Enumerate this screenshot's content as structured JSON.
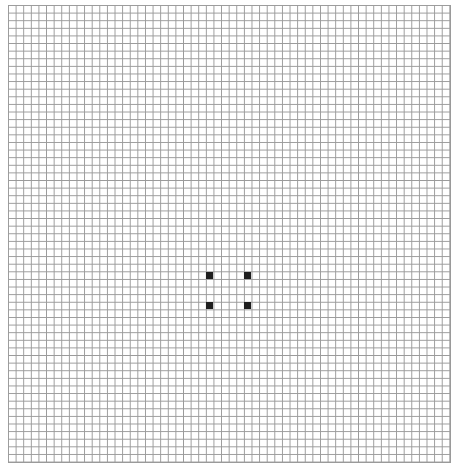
{
  "game": {
    "type": "cellular-automaton-grid",
    "columns": 58,
    "rows": 60,
    "cell_size_px": 7.62,
    "grid_color": "#9a9a9a",
    "live_color": "#1e1e1e",
    "dead_color": "#ffffff",
    "live_cells": [
      {
        "col": 26,
        "row": 35
      },
      {
        "col": 31,
        "row": 35
      },
      {
        "col": 26,
        "row": 39
      },
      {
        "col": 31,
        "row": 39
      }
    ]
  }
}
